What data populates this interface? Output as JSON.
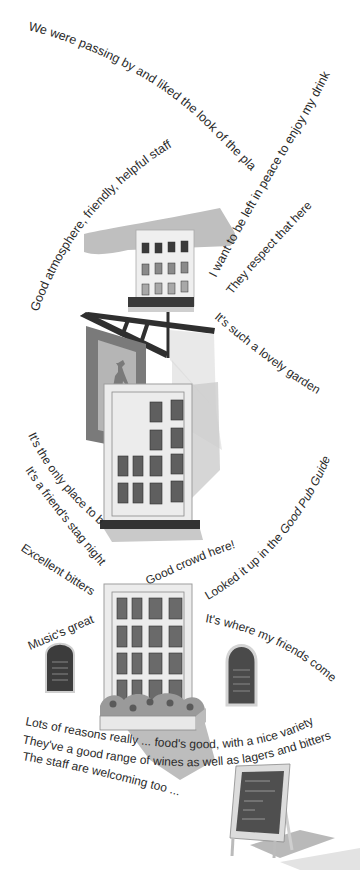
{
  "illustration": {
    "subject": "pub-exterior-collage",
    "colors": {
      "background": "#ffffff",
      "text": "#2a2a2a",
      "dark_trim": "#3a3a3a",
      "window_pane": "#6e6e6e",
      "window_dark": "#4a4a4a",
      "wall": "#ececec",
      "frame": "#bdbdbd",
      "roof": "#b8b8b8",
      "shadow": "#c8c8c8",
      "sign_board": "#7a7a7a",
      "sign_inner": "#b0b0b0",
      "horse": "#7d7d7d",
      "flowers": "#8a8a8a",
      "chalkboard": "#4a4a4a"
    }
  },
  "quotes": {
    "passing_by": "We were passing by and liked the look of the place",
    "good_atmosphere": "Good atmosphere, friendly, helpful staff",
    "left_in_peace": "I want to be left in peace to enjoy my drink",
    "respect": "They respect that here",
    "garden": "It's such a lovely garden",
    "only_place": "It's the only place to be!",
    "stag_night": "It's a friend's stag night",
    "good_crowd": "Good crowd here!",
    "pub_guide_prefix": "Looked it up in the ",
    "pub_guide_title": "Good Pub Guide",
    "excellent_bitters": "Excellent bitters",
    "music": "Music's great",
    "friends_come": "It's where my friends come",
    "lots_of_reasons": "Lots of reasons really ... food's good, with a nice variety",
    "wines": "They've a good range of wines as well as lagers and bitters",
    "staff_welcoming": "The staff are welcoming too ..."
  }
}
